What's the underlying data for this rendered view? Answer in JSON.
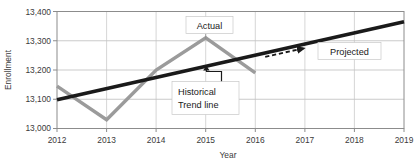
{
  "chart_data": {
    "type": "line",
    "title": "",
    "xlabel": "Year",
    "ylabel": "Enrollment",
    "x": [
      2012,
      2013,
      2014,
      2015,
      2016,
      2017,
      2018,
      2019
    ],
    "xtick_labels": [
      "2012",
      "2013",
      "2014",
      "2015",
      "2016",
      "2017",
      "2018",
      "2019"
    ],
    "xlim": [
      2012,
      2019
    ],
    "ylim": [
      13000,
      13400
    ],
    "ytick_labels": [
      "13,000",
      "13,100",
      "13,200",
      "13,300",
      "13,400"
    ],
    "ytick_values": [
      13000,
      13100,
      13200,
      13300,
      13400
    ],
    "grid": true,
    "legend": "none",
    "series": [
      {
        "name": "Actual",
        "color": "#9b9b9b",
        "style": "solid",
        "x": [
          2012,
          2013,
          2014,
          2015,
          2016
        ],
        "values": [
          13145,
          13030,
          13200,
          13310,
          13190
        ]
      },
      {
        "name": "Historical Trend line",
        "color": "#1a1a1a",
        "style": "solid",
        "x": [
          2012,
          2019
        ],
        "values": [
          13098,
          13365
        ]
      },
      {
        "name": "Projected",
        "color": "#1a1a1a",
        "style": "dashed-arrow",
        "x": [
          2016.2,
          2017.0
        ],
        "values": [
          13245,
          13275
        ]
      }
    ],
    "annotations": [
      {
        "label": "Actual",
        "target_x": 2015,
        "target_y": 13310
      },
      {
        "label_line1": "Historical",
        "label_line2": "Trend line",
        "target_x": 2015,
        "target_y": 13208
      },
      {
        "label": "Projected",
        "target_x": 2018,
        "target_y": 13255
      }
    ]
  },
  "axes": {
    "y_title": "Enrollment",
    "x_title": "Year",
    "y_ticks": [
      "13,400",
      "13,300",
      "13,200",
      "13,100",
      "13,000"
    ],
    "x_ticks": [
      "2012",
      "2013",
      "2014",
      "2015",
      "2016",
      "2017",
      "2018",
      "2019"
    ]
  },
  "callouts": {
    "actual": "Actual",
    "historical_1": "Historical",
    "historical_2": "Trend line",
    "projected": "Projected"
  },
  "colors": {
    "actual_line": "#9b9b9b",
    "trend_line": "#1a1a1a",
    "grid": "#b5b5b5",
    "axis": "#8c8c8c",
    "text": "#3b3b3b",
    "background": "#ffffff"
  }
}
